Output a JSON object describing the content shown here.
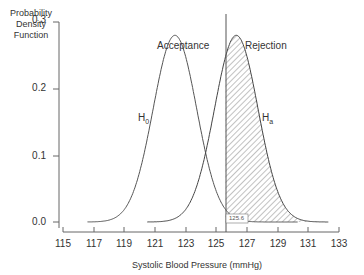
{
  "chart_data": {
    "type": "area",
    "title": "",
    "xlabel": "Systolic Blood Pressure (mmHg)",
    "ylabel": "Probability Density Function",
    "xlim": [
      115,
      133
    ],
    "ylim": [
      0,
      0.3
    ],
    "x_ticks": [
      "115",
      "117",
      "119",
      "121",
      "123",
      "125",
      "127",
      "129",
      "131",
      "133"
    ],
    "y_ticks": [
      "0.0",
      "0.1",
      "0.2",
      "0.3"
    ],
    "grid": false,
    "series": [
      {
        "name": "H0",
        "label_main": "H",
        "label_sub": "0",
        "mean": 122.3,
        "sd": 1.42,
        "peak": 0.28
      },
      {
        "name": "Ha",
        "label_main": "H",
        "label_sub": "a",
        "mean": 126.3,
        "sd": 1.42,
        "peak": 0.28,
        "shaded_from": 125.6
      }
    ],
    "annotations": {
      "acceptance": "Acceptance",
      "rejection": "Rejection",
      "threshold_value": "125.6"
    }
  }
}
